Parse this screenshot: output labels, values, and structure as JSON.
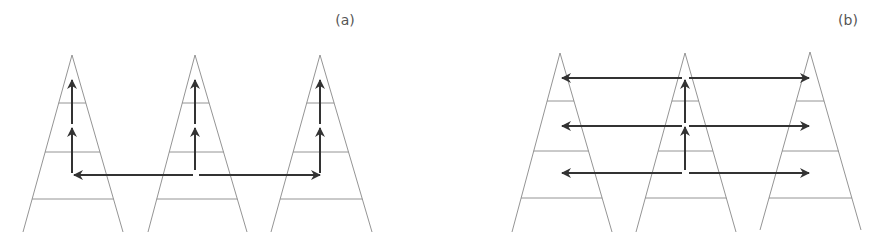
{
  "figure": {
    "panels": [
      {
        "id": "a",
        "label": "(a)",
        "label_pos": [
          345,
          25
        ],
        "description": "Three pyramids; vertical propagation up each pyramid, horizontal transfer only at lowest arrow level from middle pyramid",
        "pyramids": [
          {
            "apex": [
              72,
              55
            ],
            "base_left": [
              23,
              232
            ],
            "base_right": [
              123,
              232
            ]
          },
          {
            "apex": [
              195,
              55
            ],
            "base_left": [
              148,
              232
            ],
            "base_right": [
              247,
              232
            ]
          },
          {
            "apex": [
              320,
              55
            ],
            "base_left": [
              271,
              232
            ],
            "base_right": [
              372,
              232
            ]
          }
        ],
        "rung_levels_y": [
          103,
          152,
          199
        ],
        "vertical_arrows": [
          {
            "x": 72,
            "from_y": 173,
            "to_y": 128
          },
          {
            "x": 72,
            "from_y": 124,
            "to_y": 80
          },
          {
            "x": 195,
            "from_y": 170,
            "to_y": 128
          },
          {
            "x": 195,
            "from_y": 124,
            "to_y": 80
          },
          {
            "x": 320,
            "from_y": 173,
            "to_y": 128
          },
          {
            "x": 320,
            "from_y": 124,
            "to_y": 80
          }
        ],
        "horizontal_arrows": [
          {
            "y": 175,
            "from_x": 193,
            "to_x": 74
          },
          {
            "y": 175,
            "from_x": 199,
            "to_x": 320
          }
        ]
      },
      {
        "id": "b",
        "label": "(b)",
        "label_pos": [
          848,
          25
        ],
        "description": "Three pyramids; vertical propagation only in middle pyramid, horizontal transfer to neighbours at every level",
        "pyramids": [
          {
            "apex": [
              560,
              53
            ],
            "base_left": [
              512,
              232
            ],
            "base_right": [
              612,
              232
            ]
          },
          {
            "apex": [
              685,
              53
            ],
            "base_left": [
              636,
              232
            ],
            "base_right": [
              736,
              232
            ]
          },
          {
            "apex": [
              810,
              52
            ],
            "base_left": [
              760,
              230
            ],
            "base_right": [
              861,
              230
            ]
          }
        ],
        "rung_levels_y": [
          101,
          151,
          198
        ],
        "vertical_arrows": [
          {
            "x": 685,
            "from_y": 170,
            "to_y": 127
          },
          {
            "x": 685,
            "from_y": 123,
            "to_y": 80
          }
        ],
        "horizontal_arrows": [
          {
            "y": 78,
            "from_x": 682,
            "to_x": 562
          },
          {
            "y": 78,
            "from_x": 689,
            "to_x": 809
          },
          {
            "y": 126,
            "from_x": 682,
            "to_x": 562
          },
          {
            "y": 126,
            "from_x": 689,
            "to_x": 809
          },
          {
            "y": 173,
            "from_x": 682,
            "to_x": 562
          },
          {
            "y": 173,
            "from_x": 689,
            "to_x": 809
          }
        ]
      }
    ],
    "colors": {
      "outline": "#888888",
      "arrow": "#333333",
      "label": "#555555",
      "background": "#ffffff"
    }
  }
}
